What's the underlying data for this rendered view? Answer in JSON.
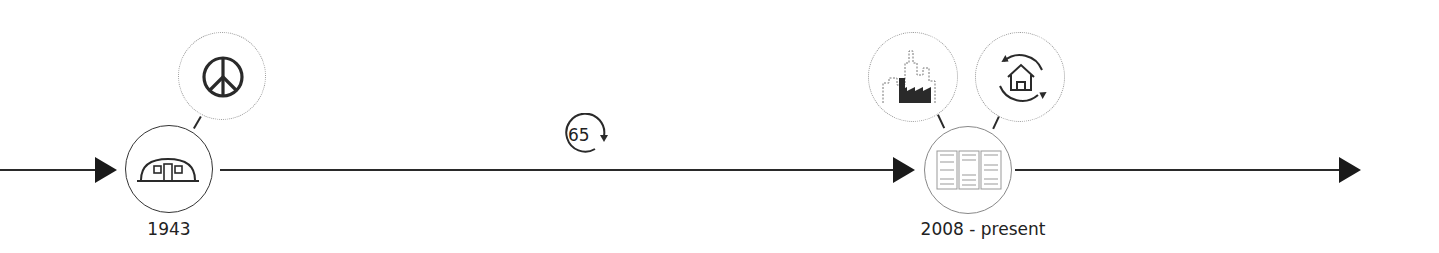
{
  "timeline": {
    "line_color": "#2a2a2a",
    "milestones": [
      {
        "label": "1943",
        "icon": "quonset-hut-icon",
        "satellites": [
          "peace-sign-icon"
        ]
      },
      {
        "label": "2008 - present",
        "icon": "shelving-units-icon",
        "satellites": [
          "city-factory-icon",
          "house-cycle-icon"
        ]
      }
    ],
    "cycle_badge": {
      "value": "65",
      "icon": "cycle-arrow-icon"
    }
  }
}
